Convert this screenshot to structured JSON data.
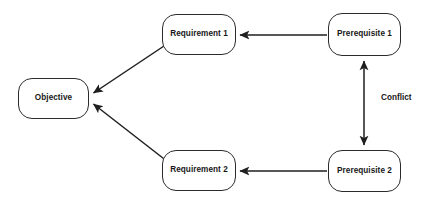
{
  "diagram": {
    "background_color": "#ffffff",
    "node_border_color": "#2b2b2b",
    "text_color": "#171717",
    "line_color": "#1f1f1f",
    "nodes": [
      {
        "id": "objective",
        "label": "Objective",
        "name": "node-objective"
      },
      {
        "id": "requirement1",
        "label": "Requirement 1",
        "name": "node-requirement-1"
      },
      {
        "id": "requirement2",
        "label": "Requirement 2",
        "name": "node-requirement-2"
      },
      {
        "id": "prerequisite1",
        "label": "Prerequisite 1",
        "name": "node-prerequisite-1"
      },
      {
        "id": "prerequisite2",
        "label": "Prerequisite 2",
        "name": "node-prerequisite-2"
      }
    ],
    "edges": [
      {
        "id": "e1",
        "from": "prerequisite1",
        "to": "requirement1",
        "arrows": "single",
        "label": ""
      },
      {
        "id": "e2",
        "from": "prerequisite2",
        "to": "requirement2",
        "arrows": "single",
        "label": ""
      },
      {
        "id": "e3",
        "from": "requirement1",
        "to": "objective",
        "arrows": "single",
        "label": ""
      },
      {
        "id": "e4",
        "from": "requirement2",
        "to": "objective",
        "arrows": "single",
        "label": ""
      },
      {
        "id": "e5",
        "from": "prerequisite2",
        "to": "prerequisite1",
        "arrows": "double",
        "label": "Conflict"
      }
    ],
    "labels": {
      "conflict": "Conflict"
    }
  }
}
